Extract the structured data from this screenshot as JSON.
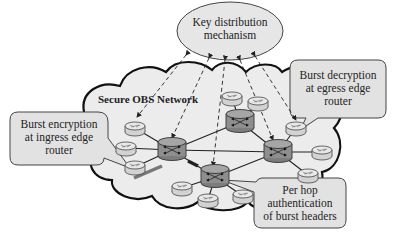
{
  "diagram": {
    "title": "Secure OBS Network",
    "key_distribution": {
      "line1": "Key distribution",
      "line2": "mechanism"
    },
    "callouts": {
      "ingress": {
        "line1": "Burst encryption",
        "line2": "at ingress edge",
        "line3": "router"
      },
      "egress": {
        "line1": "Burst decryption",
        "line2": "at egress edge",
        "line3": "router"
      },
      "per_hop": {
        "line1": "Per hop",
        "line2": "authentication",
        "line3": "of burst headers"
      }
    },
    "colors": {
      "cloud_fill": "#ececec",
      "core_router": "#8e8e8e",
      "edge_router": "#dcdcdc",
      "callout_fill": "#e2e2e2",
      "ellipse_fill": "#e6e6e6",
      "stroke": "#222222"
    },
    "nodes": {
      "core_routers": [
        "C1",
        "C2",
        "C3",
        "C4"
      ],
      "edge_routers": [
        "E1",
        "E2",
        "E3",
        "E4",
        "E5",
        "E6",
        "E7",
        "E8",
        "E9",
        "E10",
        "E11"
      ]
    }
  }
}
